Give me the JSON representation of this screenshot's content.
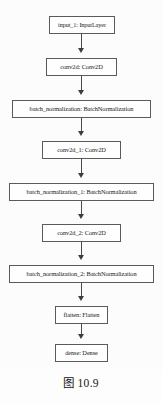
{
  "figure": {
    "caption": "图 10.9",
    "type": "neural-network-architecture-graph",
    "edge_color": "#4a4a4a",
    "node_border_color": "#5a5a5a",
    "node_fill_color": "#fefefe",
    "background_color": "#fcfcfc"
  },
  "graph": {
    "nodes": [
      {
        "id": "input_1",
        "label": "input_1: InputLayer",
        "layer_name": "input_1",
        "layer_type": "InputLayer",
        "x": 49,
        "y": 16,
        "width": 66,
        "height": 18,
        "font_size": 6.2
      },
      {
        "id": "conv2d",
        "label": "conv2d: Conv2D",
        "layer_name": "conv2d",
        "layer_type": "Conv2D",
        "x": 46,
        "y": 58,
        "width": 71,
        "height": 18,
        "font_size": 6.4
      },
      {
        "id": "batch_normalization",
        "label": "batch_normalization: BatchNormalization",
        "layer_name": "batch_normalization",
        "layer_type": "BatchNormalization",
        "x": 12,
        "y": 100,
        "width": 139,
        "height": 18,
        "font_size": 6.4
      },
      {
        "id": "conv2d_1",
        "label": "conv2d_1: Conv2D",
        "layer_name": "conv2d_1",
        "layer_type": "Conv2D",
        "x": 42,
        "y": 141,
        "width": 79,
        "height": 18,
        "font_size": 6.4
      },
      {
        "id": "batch_normalization_1",
        "label": "batch_normalization_1: BatchNormalization",
        "layer_name": "batch_normalization_1",
        "layer_type": "BatchNormalization",
        "x": 9,
        "y": 183,
        "width": 145,
        "height": 18,
        "font_size": 6.4
      },
      {
        "id": "conv2d_2",
        "label": "conv2d_2: Conv2D",
        "layer_name": "conv2d_2",
        "layer_type": "Conv2D",
        "x": 42,
        "y": 224,
        "width": 79,
        "height": 18,
        "font_size": 6.4
      },
      {
        "id": "batch_normalization_2",
        "label": "batch_normalization_2: BatchNormalization",
        "layer_name": "batch_normalization_2",
        "layer_type": "BatchNormalization",
        "x": 9,
        "y": 265,
        "width": 145,
        "height": 18,
        "font_size": 6.4
      },
      {
        "id": "flatten",
        "label": "flatten: Flatten",
        "layer_name": "flatten",
        "layer_type": "Flatten",
        "x": 55,
        "y": 306,
        "width": 53,
        "height": 18,
        "font_size": 6.4
      },
      {
        "id": "dense",
        "label": "dense: Dense",
        "layer_name": "dense",
        "layer_type": "Dense",
        "x": 55,
        "y": 344,
        "width": 53,
        "height": 18,
        "font_size": 6.4
      }
    ],
    "edges": [
      {
        "from": "input_1",
        "to": "conv2d",
        "x": 81,
        "y": 34,
        "length": 19
      },
      {
        "from": "conv2d",
        "to": "batch_normalization",
        "x": 81,
        "y": 76,
        "length": 19
      },
      {
        "from": "batch_normalization",
        "to": "conv2d_1",
        "x": 81,
        "y": 118,
        "length": 18
      },
      {
        "from": "conv2d_1",
        "to": "batch_normalization_1",
        "x": 81,
        "y": 159,
        "length": 19
      },
      {
        "from": "batch_normalization_1",
        "to": "conv2d_2",
        "x": 81,
        "y": 201,
        "length": 18
      },
      {
        "from": "conv2d_2",
        "to": "batch_normalization_2",
        "x": 81,
        "y": 242,
        "length": 18
      },
      {
        "from": "batch_normalization_2",
        "to": "flatten",
        "x": 81,
        "y": 283,
        "length": 18
      },
      {
        "from": "flatten",
        "to": "dense",
        "x": 81,
        "y": 324,
        "length": 15
      }
    ]
  }
}
